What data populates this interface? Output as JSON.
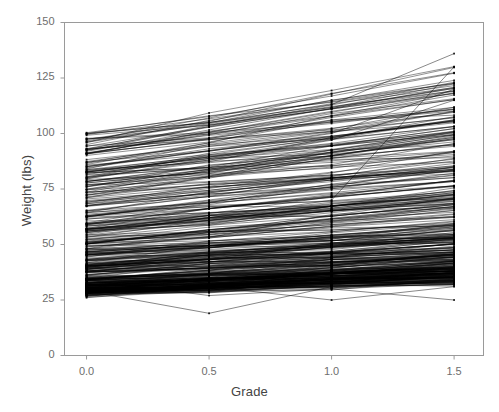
{
  "chart_data": {
    "type": "line",
    "title": "",
    "subtitle": "",
    "xlabel": "Grade",
    "ylabel": "Weight (lbs)",
    "xlim": [
      -0.09,
      1.62
    ],
    "ylim": [
      0,
      150
    ],
    "xticks": [
      0.0,
      0.5,
      1.0,
      1.5
    ],
    "xticklabels": [
      "0.0",
      "0.5",
      "1.0",
      "1.5"
    ],
    "yticks": [
      0,
      25,
      50,
      75,
      100,
      125,
      150
    ],
    "yticklabels": [
      "0",
      "25",
      "50",
      "75",
      "100",
      "125",
      "150"
    ],
    "grid": false,
    "legend": null,
    "marker": "point",
    "line_color": "#000000",
    "frame_color": "#9a9a9a",
    "background": "#ffffff",
    "categories": [
      "0.0",
      "0.5",
      "1.0",
      "1.5"
    ],
    "x": [
      0.0,
      0.5,
      1.0,
      1.5
    ],
    "n_series": 420,
    "series_summary": [
      {
        "name": "grade 0.0",
        "min": 28,
        "max": 100,
        "median": 46,
        "q1": 38,
        "q3": 56,
        "dense_band": [
          30,
          63
        ]
      },
      {
        "name": "grade 0.5",
        "min": 19,
        "max": 100,
        "median": 50,
        "q1": 41,
        "q3": 61,
        "dense_band": [
          31,
          68
        ]
      },
      {
        "name": "grade 1.0",
        "min": 25,
        "max": 100,
        "median": 54,
        "q1": 44,
        "q3": 66,
        "dense_band": [
          33,
          73
        ]
      },
      {
        "name": "grade 1.5",
        "min": 25,
        "max": 136,
        "median": 58,
        "q1": 47,
        "q3": 72,
        "dense_band": [
          34,
          80
        ]
      }
    ],
    "notable_series": [
      {
        "name": "outlier-high-1",
        "values": [
          100,
          105,
          113,
          136
        ]
      },
      {
        "name": "outlier-high-2",
        "values": [
          56,
          62,
          70,
          130
        ]
      },
      {
        "name": "outlier-high-3",
        "values": [
          85,
          92,
          100,
          120
        ]
      },
      {
        "name": "outlier-high-4",
        "values": [
          82,
          88,
          97,
          115
        ]
      },
      {
        "name": "outlier-low-1",
        "values": [
          29,
          19,
          31,
          33
        ]
      },
      {
        "name": "outlier-low-2",
        "values": [
          30,
          31,
          25,
          31
        ]
      },
      {
        "name": "outlier-low-3",
        "values": [
          34,
          27,
          30,
          25
        ]
      }
    ]
  },
  "axes": {
    "x": {
      "title": "Grade",
      "ticks": [
        {
          "value": 0.0,
          "label": "0.0"
        },
        {
          "value": 0.5,
          "label": "0.5"
        },
        {
          "value": 1.0,
          "label": "1.0"
        },
        {
          "value": 1.5,
          "label": "1.5"
        }
      ]
    },
    "y": {
      "title": "Weight (lbs)",
      "ticks": [
        {
          "value": 0,
          "label": "0"
        },
        {
          "value": 25,
          "label": "25"
        },
        {
          "value": 50,
          "label": "50"
        },
        {
          "value": 75,
          "label": "75"
        },
        {
          "value": 100,
          "label": "100"
        },
        {
          "value": 125,
          "label": "125"
        },
        {
          "value": 150,
          "label": "150"
        }
      ]
    }
  }
}
